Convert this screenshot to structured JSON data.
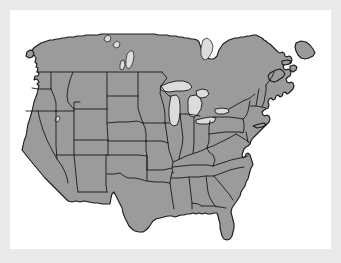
{
  "figure": {
    "title": "Map of the contiguous United States with state boundaries",
    "kind": "reference-map",
    "frame_color": "#e9e9e9",
    "background_color": "#ffffff",
    "land_color": "#9b9b9b",
    "border_color": "#1a1a1a",
    "water_color": "#dcdcdc"
  },
  "regions": {
    "united_states_label": "United States",
    "canada_label": "Canada",
    "great_lakes_label": "Great Lakes"
  },
  "features": [
    {
      "name": "continental-landmass",
      "type": "land"
    },
    {
      "name": "state-boundaries",
      "type": "border"
    },
    {
      "name": "lake-superior",
      "type": "water"
    },
    {
      "name": "lake-michigan",
      "type": "water"
    },
    {
      "name": "lake-huron",
      "type": "water"
    },
    {
      "name": "lake-erie",
      "type": "water"
    },
    {
      "name": "lake-ontario",
      "type": "water"
    },
    {
      "name": "lake-winnipeg",
      "type": "water"
    },
    {
      "name": "great-salt-lake",
      "type": "water"
    }
  ]
}
